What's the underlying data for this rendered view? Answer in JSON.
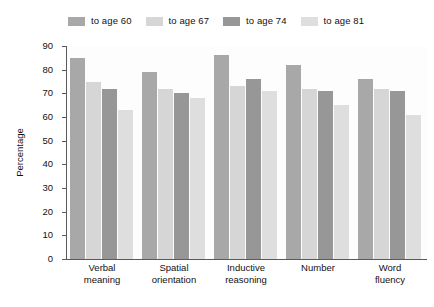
{
  "chart_data": {
    "type": "bar",
    "title": "",
    "xlabel": "",
    "ylabel": "Percentage",
    "ylim": [
      0,
      90
    ],
    "ytick_step": 10,
    "yticks": [
      90,
      80,
      70,
      60,
      50,
      40,
      30,
      20,
      10,
      0
    ],
    "grid": false,
    "legend_position": "top",
    "categories": [
      "Verbal meaning",
      "Spatial orientation",
      "Inductive reasoning",
      "Number",
      "Word fluency"
    ],
    "category_lines": [
      [
        "Verbal",
        "meaning"
      ],
      [
        "Spatial",
        "orientation"
      ],
      [
        "Inductive",
        "reasoning"
      ],
      [
        "Number",
        ""
      ],
      [
        "Word",
        "fluency"
      ]
    ],
    "series": [
      {
        "name": "to age 60",
        "color": "#a8a8a8",
        "values": [
          85,
          79,
          86,
          82,
          76
        ]
      },
      {
        "name": "to age 67",
        "color": "#d6d6d6",
        "values": [
          75,
          72,
          73,
          72,
          72
        ]
      },
      {
        "name": "to age 74",
        "color": "#979797",
        "values": [
          72,
          70,
          76,
          71,
          71
        ]
      },
      {
        "name": "to age 81",
        "color": "#dedede",
        "values": [
          63,
          68,
          71,
          65,
          61
        ]
      }
    ]
  },
  "axis": {
    "y_title": "Percentage"
  },
  "colors": {
    "axis_line": "#5a5a5a",
    "text": "#111111",
    "plot_background": "#fdfdfd",
    "page_background": "#ffffff"
  }
}
